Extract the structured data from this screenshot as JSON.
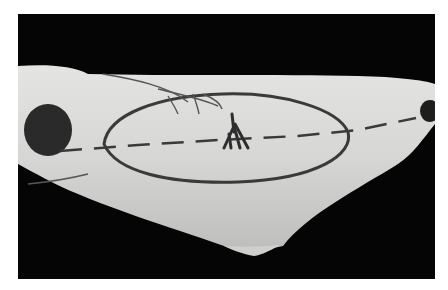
{
  "image": {
    "kind": "clinical-photograph",
    "mode": "grayscale",
    "subject": "skin with surgical pen markings",
    "colors": {
      "background": "#ffffff",
      "photo_background": "#050505",
      "skin": "#d8d8d6",
      "marking": "#3a3a3a",
      "dark_patch": "#2a2a2a"
    },
    "elements": [
      {
        "id": "elliptical-outline",
        "description": "large ellipse drawn in center"
      },
      {
        "id": "dashed-axis-line",
        "description": "horizontal dashed line across the ellipse"
      },
      {
        "id": "central-branch-mark",
        "description": "small forked mark at center of ellipse"
      },
      {
        "id": "vessel-lines",
        "description": "branching vessel lines at top"
      },
      {
        "id": "left-dark-patch",
        "description": "dark rounded patch on left"
      },
      {
        "id": "right-dark-patch",
        "description": "dark rounded patch at right edge"
      }
    ]
  }
}
